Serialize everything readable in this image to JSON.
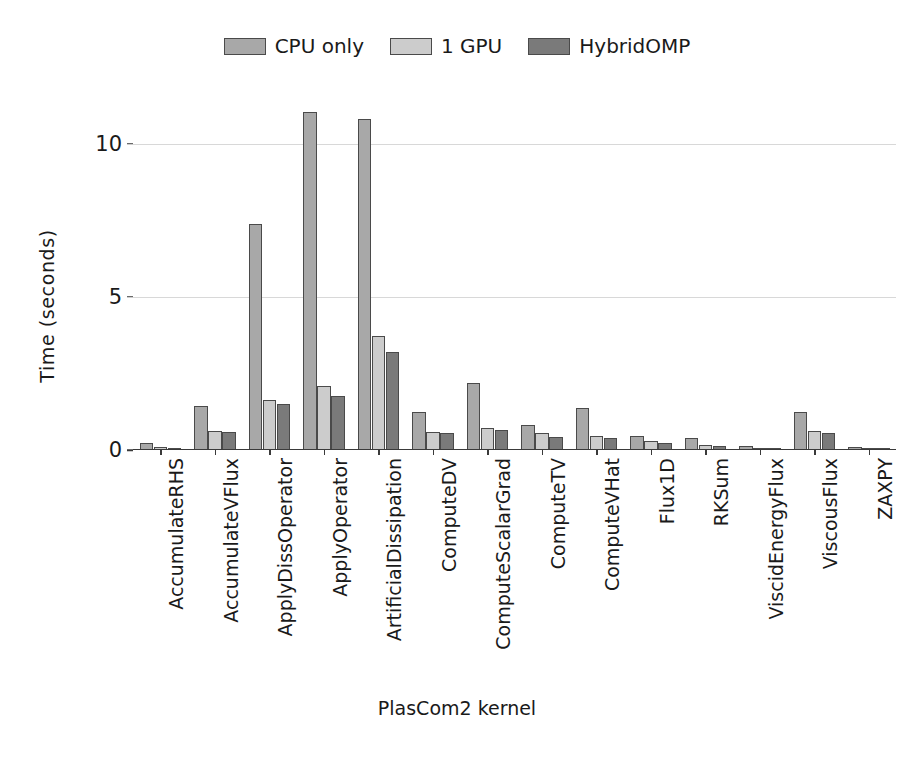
{
  "chart_data": {
    "type": "bar",
    "title": "",
    "xlabel": "PlasCom2 kernel",
    "ylabel": "Time (seconds)",
    "ylim": [
      0,
      11.6
    ],
    "yticks": [
      0,
      5,
      10
    ],
    "ytick_labels": [
      "0",
      "5",
      "10"
    ],
    "grid": "horizontal",
    "legend_position": "top-center",
    "categories": [
      "AccumulateRHS",
      "AccumulateVFlux",
      "ApplyDissOperator",
      "ApplyOperator",
      "ArtificialDissipation",
      "ComputeDV",
      "ComputeScalarGrad",
      "ComputeTV",
      "ComputeVHat",
      "Flux1D",
      "RKSum",
      "ViscidEnergyFlux",
      "ViscousFlux",
      "ZAXPY"
    ],
    "series": [
      {
        "name": "CPU only",
        "color": "#a8a8a8",
        "values": [
          0.22,
          1.45,
          7.4,
          11.05,
          10.8,
          1.25,
          2.2,
          0.82,
          1.38,
          0.46,
          0.38,
          0.13,
          1.25,
          0.1
        ]
      },
      {
        "name": "1 GPU",
        "color": "#cccccc",
        "values": [
          0.1,
          0.62,
          1.62,
          2.1,
          3.72,
          0.6,
          0.73,
          0.55,
          0.45,
          0.3,
          0.18,
          0.07,
          0.63,
          0.05
        ]
      },
      {
        "name": "HybridOMP",
        "color": "#7a7a7a",
        "values": [
          0.08,
          0.58,
          1.5,
          1.78,
          3.2,
          0.55,
          0.66,
          0.42,
          0.4,
          0.24,
          0.13,
          0.05,
          0.55,
          0.04
        ]
      }
    ]
  },
  "legend": {
    "entries": [
      {
        "label": "CPU only",
        "color": "#a8a8a8"
      },
      {
        "label": "1 GPU",
        "color": "#cccccc"
      },
      {
        "label": "HybridOMP",
        "color": "#7a7a7a"
      }
    ]
  },
  "axes": {
    "y_title": "Time (seconds)",
    "x_title": "PlasCom2 kernel"
  }
}
